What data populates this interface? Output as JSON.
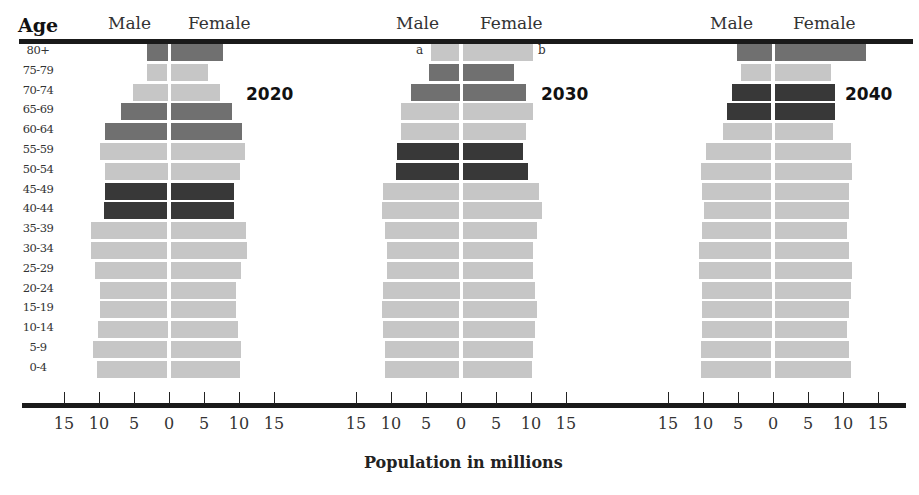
{
  "labels": {
    "age": "Age",
    "male": "Male",
    "female": "Female",
    "x_axis_title": "Population in millions",
    "marker_a": "a",
    "marker_b": "b"
  },
  "colors": {
    "light": "#c6c6c6",
    "medium": "#707070",
    "dark": "#383838",
    "rule": "#1a1a1a"
  },
  "chart_data": {
    "type": "bar",
    "subtype": "population-pyramid",
    "title": "",
    "xlabel": "Population in millions",
    "ylabel": "Age",
    "xlim": [
      -15,
      15
    ],
    "x_ticks": [
      15,
      10,
      5,
      0,
      5,
      10,
      15
    ],
    "categories": [
      "80+",
      "75-79",
      "70-74",
      "65-69",
      "60-64",
      "55-59",
      "50-54",
      "45-49",
      "40-44",
      "35-39",
      "30-34",
      "25-29",
      "20-24",
      "15-19",
      "10-14",
      "5-9",
      "0-4"
    ],
    "panels": [
      {
        "year": "2020",
        "male": [
          3.0,
          2.9,
          5.0,
          6.7,
          8.9,
          9.7,
          9.0,
          8.9,
          9.1,
          10.9,
          10.9,
          10.3,
          9.7,
          9.6,
          10.0,
          10.6,
          10.1
        ],
        "female": [
          7.5,
          5.4,
          7.1,
          8.8,
          10.2,
          10.6,
          9.9,
          9.1,
          9.1,
          10.8,
          10.9,
          10.1,
          9.4,
          9.3,
          9.7,
          10.0,
          9.9
        ],
        "shade": [
          "medium",
          "light",
          "light",
          "medium",
          "medium",
          "light",
          "light",
          "dark",
          "dark",
          "light",
          "light",
          "light",
          "light",
          "light",
          "light",
          "light",
          "light"
        ]
      },
      {
        "year": "2030",
        "male": [
          4.1,
          4.4,
          7.0,
          8.3,
          8.4,
          8.9,
          9.1,
          10.9,
          11.1,
          10.7,
          10.3,
          10.4,
          11.0,
          11.1,
          10.9,
          10.7,
          10.7
        ],
        "female": [
          10.0,
          7.3,
          9.1,
          10.1,
          9.0,
          8.7,
          9.3,
          10.9,
          11.3,
          10.6,
          10.0,
          10.1,
          10.4,
          10.6,
          10.4,
          10.1,
          9.9
        ],
        "shade": [
          "light",
          "medium",
          "medium",
          "light",
          "light",
          "dark",
          "dark",
          "light",
          "light",
          "light",
          "light",
          "light",
          "light",
          "light",
          "light",
          "light",
          "light"
        ]
      },
      {
        "year": "2040",
        "male": [
          5.0,
          4.3,
          5.7,
          6.3,
          7.0,
          9.4,
          10.1,
          9.9,
          9.6,
          9.9,
          10.3,
          10.3,
          10.0,
          10.0,
          10.0,
          10.1,
          10.1
        ],
        "female": [
          13.0,
          8.0,
          8.7,
          8.6,
          8.4,
          10.9,
          11.1,
          10.7,
          10.6,
          10.3,
          10.7,
          11.1,
          10.9,
          10.6,
          10.4,
          10.6,
          10.9
        ],
        "shade": [
          "medium",
          "light",
          "dark",
          "dark",
          "light",
          "light",
          "light",
          "light",
          "light",
          "light",
          "light",
          "light",
          "light",
          "light",
          "light",
          "light",
          "light"
        ]
      }
    ],
    "legend": [],
    "grid": false,
    "annotations": [
      "a",
      "b"
    ]
  },
  "layout": {
    "centers": [
      169,
      461,
      773
    ],
    "px_per_million": 7.0,
    "row_top": 42,
    "row_pitch": 19.8
  }
}
